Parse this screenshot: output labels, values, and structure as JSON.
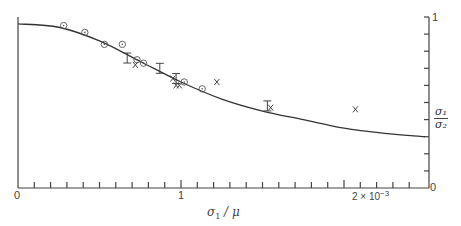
{
  "chart_data": {
    "type": "scatter",
    "title": "",
    "xlabel": "σ1 / μ",
    "ylabel": "σ1 / σ2",
    "x_tick_labels": [
      "0",
      "1",
      "2 × 10⁻³"
    ],
    "y_tick_labels": [
      "0",
      "1"
    ],
    "xlim": [
      0,
      2.5
    ],
    "ylim": [
      0,
      1
    ],
    "x_units": "×10⁻³",
    "grid": false,
    "legend": null,
    "series": [
      {
        "name": "theory curve",
        "kind": "line",
        "points": [
          [
            0,
            0.96
          ],
          [
            0.25,
            0.94
          ],
          [
            0.5,
            0.86
          ],
          [
            0.75,
            0.74
          ],
          [
            1.0,
            0.62
          ],
          [
            1.25,
            0.52
          ],
          [
            1.5,
            0.45
          ],
          [
            1.75,
            0.4
          ],
          [
            2.0,
            0.35
          ],
          [
            2.25,
            0.32
          ],
          [
            2.5,
            0.3
          ]
        ]
      },
      {
        "name": "circles",
        "marker": "circle-dot",
        "points": [
          [
            0.28,
            0.95
          ],
          [
            0.41,
            0.91
          ],
          [
            0.53,
            0.84
          ],
          [
            0.64,
            0.84
          ],
          [
            0.73,
            0.75
          ],
          [
            0.77,
            0.73
          ],
          [
            1.02,
            0.62
          ],
          [
            1.13,
            0.58
          ]
        ]
      },
      {
        "name": "error bars",
        "marker": "I-bar",
        "points": [
          [
            0.67,
            0.76
          ],
          [
            0.87,
            0.7
          ],
          [
            0.97,
            0.64
          ],
          [
            1.53,
            0.48
          ]
        ]
      },
      {
        "name": "crosses",
        "marker": "x",
        "points": [
          [
            0.72,
            0.72
          ],
          [
            0.95,
            0.64
          ],
          [
            0.97,
            0.6
          ],
          [
            0.99,
            0.6
          ],
          [
            1.22,
            0.62
          ],
          [
            1.55,
            0.47
          ],
          [
            2.07,
            0.46
          ]
        ]
      }
    ]
  },
  "labels": {
    "x_zero": "0",
    "x_one": "1",
    "x_two": "2 × 10",
    "x_exp": "−3",
    "y_zero": "0",
    "y_one": "1",
    "xlabel_num": "σ",
    "xlabel_sub": "1",
    "xlabel_rest": " / μ",
    "ylabel_num": "σ₁",
    "ylabel_den": "σ₂"
  }
}
